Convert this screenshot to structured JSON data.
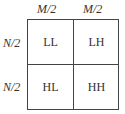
{
  "column_labels": [
    "M/2",
    "M/2"
  ],
  "row_labels": [
    "N/2",
    "N/2"
  ],
  "cells": [
    [
      "LL",
      "LH"
    ],
    [
      "HL",
      "HH"
    ]
  ]
}
